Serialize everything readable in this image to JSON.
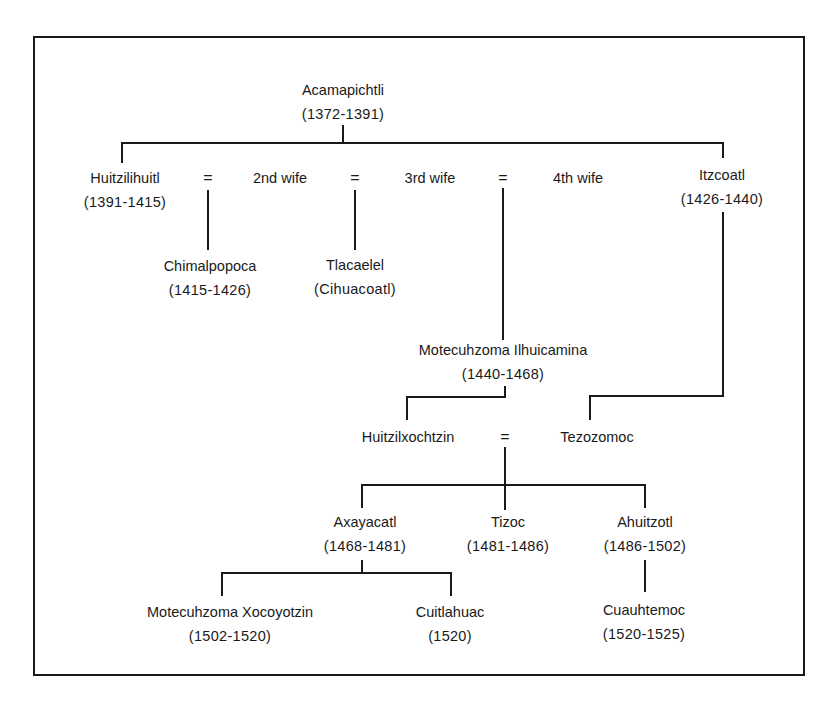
{
  "diagram": {
    "type": "genealogy",
    "title_caption_partial": "",
    "colors": {
      "line": "#1a1a1a",
      "text": "#1a1a1a",
      "background": "#ffffff"
    },
    "people": {
      "acamapichtli": {
        "name": "Acamapichtli",
        "dates": "(1372-1391)"
      },
      "huitzilihuitl": {
        "name": "Huitzilihuitl",
        "dates": "(1391-1415)"
      },
      "wife2": {
        "name": "2nd wife"
      },
      "wife3": {
        "name": "3rd wife"
      },
      "wife4": {
        "name": "4th wife"
      },
      "itzcoatl": {
        "name": "Itzcoatl",
        "dates": "(1426-1440)"
      },
      "chimalpopoca": {
        "name": "Chimalpopoca",
        "dates": "(1415-1426)"
      },
      "tlacaelel": {
        "name": "Tlacaelel",
        "dates": "(Cihuacoatl)"
      },
      "motecuhzoma_ilhuicamina": {
        "name": "Motecuhzoma Ilhuicamina",
        "dates": "(1440-1468)"
      },
      "huitzilxochtzin": {
        "name": "Huitzilxochtzin"
      },
      "tezozomoc": {
        "name": "Tezozomoc"
      },
      "axayacatl": {
        "name": "Axayacatl",
        "dates": "(1468-1481)"
      },
      "tizoc": {
        "name": "Tizoc",
        "dates": "(1481-1486)"
      },
      "ahuitzotl": {
        "name": "Ahuitzotl",
        "dates": "(1486-1502)"
      },
      "motecuhzoma_xocoyotzin": {
        "name": "Motecuhzoma Xocoyotzin",
        "dates": "(1502-1520)"
      },
      "cuitlahuac": {
        "name": "Cuitlahuac",
        "dates": "(1520)"
      },
      "cuauhtemoc": {
        "name": "Cuauhtemoc",
        "dates": "(1520-1525)"
      }
    },
    "marriage_symbol": "=",
    "relations": [
      {
        "parent": "Acamapichtli",
        "children": [
          "Huitzilihuitl",
          "Itzcoatl"
        ]
      },
      {
        "union": [
          "Huitzilihuitl",
          "2nd wife"
        ],
        "children": [
          "Chimalpopoca"
        ]
      },
      {
        "union": [
          "2nd wife",
          "3rd wife"
        ],
        "children": [
          "Tlacaelel"
        ]
      },
      {
        "union": [
          "3rd wife",
          "4th wife"
        ],
        "children": [
          "Motecuhzoma Ilhuicamina"
        ]
      },
      {
        "parent": "Motecuhzoma Ilhuicamina",
        "children": [
          "Huitzilxochtzin"
        ]
      },
      {
        "parent": "Itzcoatl",
        "children": [
          "Tezozomoc"
        ]
      },
      {
        "union": [
          "Huitzilxochtzin",
          "Tezozomoc"
        ],
        "children": [
          "Axayacatl",
          "Tizoc",
          "Ahuitzotl"
        ]
      },
      {
        "parent": "Axayacatl",
        "children": [
          "Motecuhzoma Xocoyotzin",
          "Cuitlahuac"
        ]
      },
      {
        "parent": "Ahuitzotl",
        "children": [
          "Cuauhtemoc"
        ]
      }
    ]
  }
}
